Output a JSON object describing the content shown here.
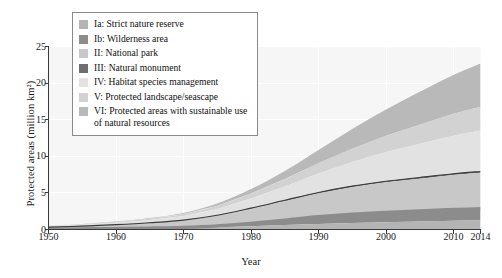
{
  "chart_data": {
    "type": "area",
    "title": "",
    "xlabel": "Year",
    "ylabel": "Protected areas (million km²)",
    "xlim": [
      1950,
      2014
    ],
    "ylim": [
      0,
      25
    ],
    "xticks": [
      1950,
      1960,
      1970,
      1980,
      1990,
      2000,
      2010,
      2014
    ],
    "yticks": [
      0,
      5,
      10,
      15,
      20,
      25
    ],
    "grid": true,
    "stacked": true,
    "legend_position": "top-left",
    "x": [
      1950,
      1955,
      1960,
      1965,
      1970,
      1975,
      1980,
      1985,
      1990,
      1995,
      2000,
      2005,
      2010,
      2014
    ],
    "series": [
      {
        "name": "Ia: Strict nature reserve",
        "color": "#b4b4b4",
        "values": [
          0.05,
          0.07,
          0.1,
          0.14,
          0.2,
          0.3,
          0.45,
          0.6,
          0.75,
          0.9,
          1.0,
          1.1,
          1.2,
          1.25
        ]
      },
      {
        "name": "Ib: Wilderness area",
        "color": "#8c8c8c",
        "values": [
          0.02,
          0.03,
          0.04,
          0.06,
          0.1,
          0.2,
          0.4,
          0.7,
          1.0,
          1.2,
          1.35,
          1.45,
          1.55,
          1.6
        ]
      },
      {
        "name": "II: National park",
        "color": "#c8c8c8",
        "values": [
          0.25,
          0.35,
          0.5,
          0.7,
          0.95,
          1.4,
          2.0,
          2.6,
          3.2,
          3.7,
          4.1,
          4.4,
          4.7,
          4.9
        ]
      },
      {
        "name": "III: Natural monument",
        "color": "#6e6e6e",
        "values": [
          0.01,
          0.01,
          0.02,
          0.02,
          0.03,
          0.05,
          0.07,
          0.09,
          0.11,
          0.13,
          0.15,
          0.16,
          0.17,
          0.18
        ]
      },
      {
        "name": "IV: Habitat species management",
        "color": "#e2e2e2",
        "values": [
          0.12,
          0.18,
          0.26,
          0.38,
          0.55,
          0.85,
          1.3,
          1.9,
          2.6,
          3.3,
          4.0,
          4.6,
          5.2,
          5.6
        ]
      },
      {
        "name": "V: Protected landscape/seascape",
        "color": "#d2d2d2",
        "values": [
          0.05,
          0.08,
          0.12,
          0.18,
          0.28,
          0.45,
          0.7,
          1.0,
          1.4,
          1.8,
          2.2,
          2.6,
          3.0,
          3.25
        ]
      },
      {
        "name": "VI: Protected areas with sustainable use of natural resources",
        "color": "#b9b9b9",
        "values": [
          0.02,
          0.03,
          0.05,
          0.08,
          0.14,
          0.3,
          0.6,
          1.1,
          1.8,
          2.7,
          3.6,
          4.5,
          5.3,
          5.9
        ]
      }
    ],
    "totals": [
      0.52,
      0.75,
      1.09,
      1.56,
      2.25,
      3.55,
      5.52,
      7.99,
      10.86,
      13.73,
      16.4,
      18.81,
      21.12,
      22.68
    ],
    "overlay_line_upper_label": "upper boundary line",
    "overlay_line_lower_label": "lower boundary line"
  },
  "legend": {
    "items": [
      {
        "label": "Ia: Strict nature reserve",
        "color": "#b4b4b4"
      },
      {
        "label": "Ib: Wilderness area",
        "color": "#8c8c8c"
      },
      {
        "label": "II: National park",
        "color": "#c8c8c8"
      },
      {
        "label": "III: Natural monument",
        "color": "#6e6e6e"
      },
      {
        "label": "IV: Habitat species management",
        "color": "#e2e2e2"
      },
      {
        "label": "V: Protected landscape/seascape",
        "color": "#d2d2d2"
      },
      {
        "label": "VI: Protected areas with sustainable use of natural resources",
        "color": "#b9b9b9"
      }
    ]
  },
  "axes": {
    "x_label": "Year",
    "y_label": "Protected areas (million km²)",
    "x_tick_labels": [
      "1950",
      "1960",
      "1970",
      "1980",
      "1990",
      "2000",
      "2010",
      "2014"
    ],
    "y_tick_labels": [
      "0",
      "5",
      "10",
      "15",
      "20",
      "25"
    ]
  },
  "colors": {
    "axis": "#3a3a3a",
    "grid": "#ffffff",
    "plot_background": "#f6f6f6",
    "outline": "#4a4a4a",
    "page_background": "#ffffff"
  }
}
